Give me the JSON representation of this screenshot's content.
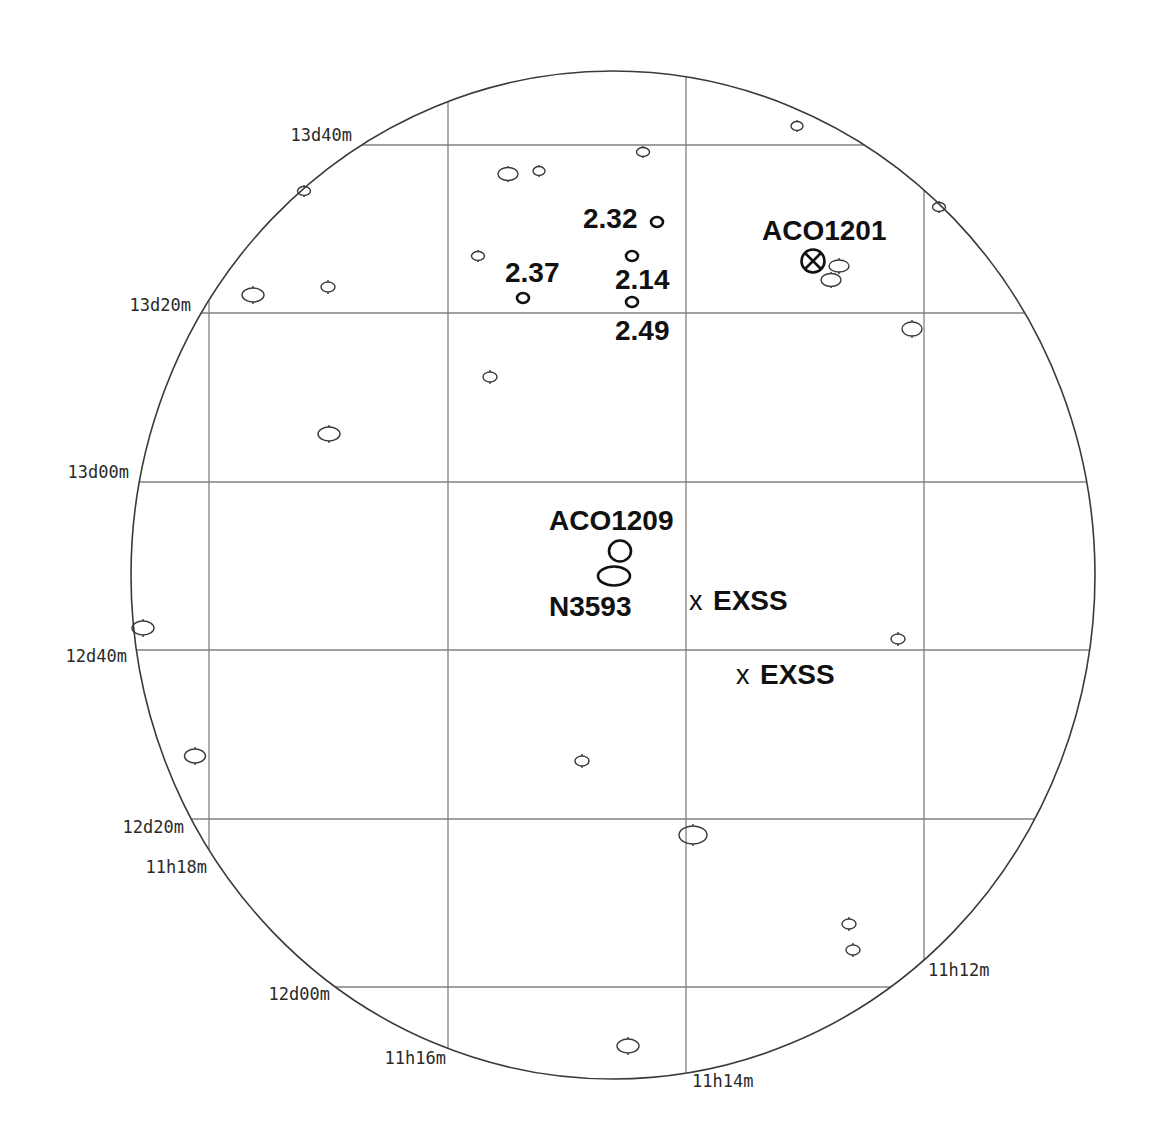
{
  "map": {
    "dec_labels": [
      "13d40m",
      "13d20m",
      "13d00m",
      "12d40m",
      "12d20m",
      "12d00m"
    ],
    "ra_labels": [
      "11h18m",
      "11h16m",
      "11h14m",
      "11h12m"
    ]
  },
  "objects": {
    "redshift_labels": [
      "2.32",
      "2.37",
      "2.14",
      "2.49"
    ],
    "clusters": [
      "ACO1201",
      "ACO1209"
    ],
    "galaxy": "N3593",
    "exss": [
      {
        "marker": "x",
        "label": "EXSS"
      },
      {
        "marker": "x",
        "label": "EXSS"
      }
    ]
  },
  "colors": {
    "background": "#ffffff",
    "grid": "#808080",
    "boundary": "#3a3a3a",
    "labels": "#111111"
  }
}
